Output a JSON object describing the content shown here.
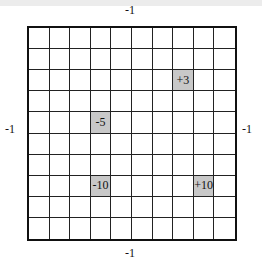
{
  "diagram": {
    "rows": 10,
    "cols": 10,
    "colors": {
      "background": "#ffffff",
      "grid_line": "#222222",
      "shaded_cell": "#c8c8c8",
      "top_band": "#ececec"
    },
    "edge_labels": {
      "top": "-1",
      "bottom": "-1",
      "left": "-1",
      "right": "-1"
    },
    "special_cells": [
      {
        "row": 2,
        "col": 7,
        "value": "+3"
      },
      {
        "row": 4,
        "col": 3,
        "value": "-5"
      },
      {
        "row": 7,
        "col": 3,
        "value": "-10"
      },
      {
        "row": 7,
        "col": 8,
        "value": "+10"
      }
    ]
  }
}
